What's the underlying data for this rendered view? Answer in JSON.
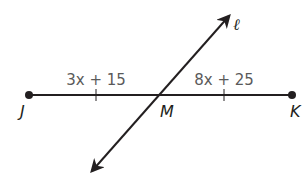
{
  "diagram": {
    "segment": {
      "start_label": "J",
      "midpoint_label": "M",
      "end_label": "K"
    },
    "line_label": "ℓ",
    "expressions": {
      "left": "3x + 15",
      "right": "8x + 25"
    },
    "colors": {
      "stroke": "#231f20",
      "expression_text": "#5a5a5a",
      "background": "#ffffff"
    }
  }
}
